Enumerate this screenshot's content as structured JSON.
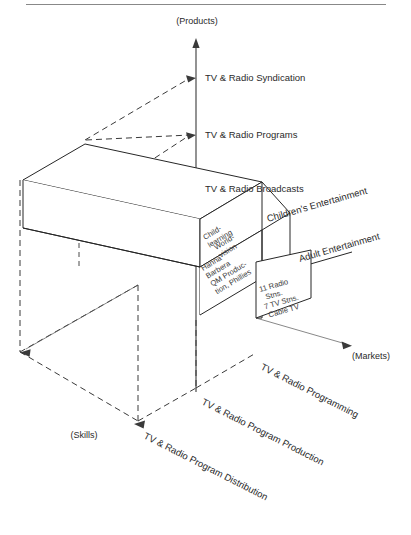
{
  "figure": {
    "type": "three-dimensional-business-definition-cube",
    "axes": {
      "vertical": {
        "name": "products-axis",
        "end_label": "(Products)",
        "ticks": [
          "TV & Radio Syndication",
          "TV & Radio Programs",
          "TV & Radio Broadcasts"
        ]
      },
      "right": {
        "name": "markets-axis",
        "end_label": "(Markets)",
        "ticks": [
          "Children's Entertainment",
          "Adult Entertainment"
        ]
      },
      "left": {
        "name": "skills-axis",
        "end_label": "(Skills)",
        "ticks": [
          "TV & Radio Programming",
          "TV & Radio Program Production",
          "TV & Radio Program Distribution"
        ]
      }
    },
    "cells": [
      {
        "id": "worldvision",
        "lines": [
          "World-",
          "vision"
        ]
      },
      {
        "id": "child-learning",
        "lines": [
          "Child-",
          "learning"
        ]
      },
      {
        "id": "hanna-barbera",
        "lines": [
          "Hanna",
          "Barbera",
          "QM Produc-",
          "tion, Phillies"
        ]
      },
      {
        "id": "stations",
        "lines": [
          "11 Radio",
          "Stns.",
          "7 TV Stns.",
          "Cable TV"
        ]
      }
    ],
    "colors": {
      "edge": "#262626",
      "dash": "#3a3a3a",
      "text": "#2a2a2a",
      "rule": "#888888",
      "background": "#ffffff"
    }
  }
}
